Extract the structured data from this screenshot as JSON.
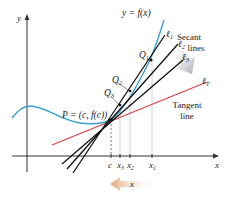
{
  "diagram": {
    "axes": {
      "x_label": "x",
      "y_label": "y",
      "ticks": [
        {
          "label": "c",
          "sub": ""
        },
        {
          "label": "x",
          "sub": "3"
        },
        {
          "label": "x",
          "sub": "2"
        },
        {
          "label": "x",
          "sub": "1"
        }
      ]
    },
    "curve_label": "y = f(x)",
    "point_label": "P = (c, f(c))",
    "points": [
      {
        "label": "Q",
        "sub": "1"
      },
      {
        "label": "Q",
        "sub": "2"
      },
      {
        "label": "Q",
        "sub": "3"
      }
    ],
    "lines": [
      {
        "label": "ℓ",
        "sub": "1"
      },
      {
        "label": "ℓ",
        "sub": "2"
      },
      {
        "label": "ℓ",
        "sub": "3"
      },
      {
        "label": "ℓ",
        "sub": "T"
      }
    ],
    "secant_caption": {
      "line1": "Secant",
      "line2": "lines"
    },
    "tangent_caption": {
      "line1": "Tangent",
      "line2": "line"
    },
    "arrow_label": "x",
    "colors": {
      "curve": "#3a9fd0",
      "tangent": "#d9424a",
      "secant": "#111111",
      "axis": "#333333",
      "guide": "#bbbbbb",
      "arrow_gray": "#b8b8c0",
      "arrow_orange": "#e8b48e"
    }
  }
}
